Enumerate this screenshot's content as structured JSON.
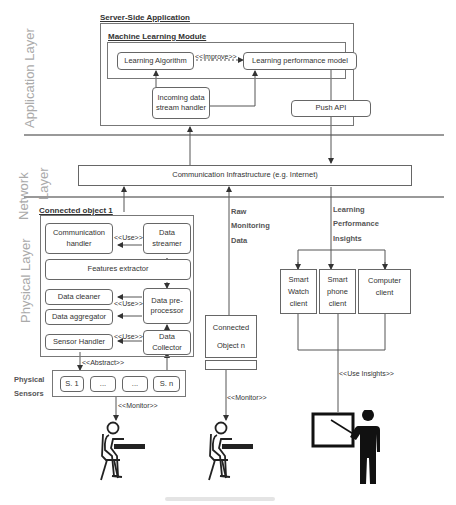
{
  "layers": {
    "application": "Application Layer",
    "network_line1": "Network",
    "network_line2": "Layer",
    "physical": "Physical Layer"
  },
  "server": {
    "title": "Server-Side Application",
    "ml_module": {
      "title": "Machine Learning Module",
      "learning_algorithm": "Learning Algorithm",
      "improve_label": "<<Improve>>",
      "performance_model": "Learning performance model"
    },
    "incoming_handler_line1": "Incoming data",
    "incoming_handler_line2": "stream handler",
    "push_api": "Push API"
  },
  "network": {
    "infrastructure": "Communication Infrastructure (e.g. Internet)"
  },
  "connected_object_1": {
    "title": "Connected object 1",
    "communication_handler_line1": "Communication",
    "communication_handler_line2": "handler",
    "use_label_1": "<<Use>>",
    "data_streamer_line1": "Data",
    "data_streamer_line2": "streamer",
    "features_extractor": "Features extractor",
    "data_cleaner": "Data cleaner",
    "use_label_2": "<<Use>>",
    "data_preprocessor_line1": "Data pre-",
    "data_preprocessor_line2": "processor",
    "data_aggregator": "Data aggregator",
    "sensor_handler": "Sensor Handler",
    "use_label_3": "<<Use>>",
    "data_collector_line1": "Data",
    "data_collector_line2": "Collector",
    "abstract_label": "<<Abstract>>"
  },
  "sensors": {
    "title_line1": "Physical",
    "title_line2": "Sensors",
    "items": [
      "S. 1",
      "...",
      "...",
      "S. n"
    ],
    "monitor_label": "<<Monitor>>"
  },
  "raw_data": {
    "line1": "Raw",
    "line2": "Monitoring",
    "line3": "Data"
  },
  "connected_object_n": {
    "line1": "Connected",
    "line2": "Object n",
    "monitor_label": "<<Monitor>>"
  },
  "insights": {
    "line1": "Learning",
    "line2": "Performance",
    "line3": "Insights",
    "use_insights_label": "<<Use Insights>>"
  },
  "clients": {
    "smart_watch": [
      "Smart",
      "Watch",
      "client"
    ],
    "smart_phone": [
      "Smart",
      "phone",
      "client"
    ],
    "computer": [
      "Computer",
      "client"
    ]
  },
  "actors": [
    "student-1",
    "student-2",
    "teacher"
  ]
}
